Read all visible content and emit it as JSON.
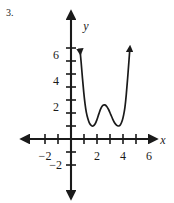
{
  "problem": {
    "number": "3."
  },
  "chart_data": {
    "type": "line",
    "title": "",
    "xlabel": "x",
    "ylabel": "y",
    "xlim": [
      -3.2,
      7.0
    ],
    "ylim": [
      -3.0,
      7.6
    ],
    "grid": false,
    "legend": null,
    "x_ticks": [
      -2,
      -1,
      1,
      2,
      3,
      4,
      5,
      6
    ],
    "x_tick_labels": [
      "−2",
      "",
      "",
      "2",
      "",
      "4",
      "",
      "6"
    ],
    "y_ticks": [
      -2,
      -1,
      1,
      2,
      3,
      4,
      5,
      6,
      7
    ],
    "y_tick_labels": [
      "−2",
      "",
      "",
      "2",
      "",
      "4",
      "",
      "6",
      ""
    ],
    "axis_arrows": [
      "left",
      "right",
      "up",
      "down"
    ],
    "series": [
      {
        "name": "quartic",
        "arrow_start": true,
        "arrow_end": true,
        "x": [
          0.7,
          0.78,
          0.88,
          0.98,
          1.08,
          1.18,
          1.3,
          1.42,
          1.55,
          1.7,
          1.85,
          2.0,
          2.15,
          2.3,
          2.45,
          2.6,
          2.75,
          2.9,
          3.05,
          3.2,
          3.35,
          3.5,
          3.65,
          3.8,
          3.95,
          4.05,
          4.15,
          4.25,
          4.35,
          4.45,
          4.52
        ],
        "y": [
          6.8,
          5.9,
          4.7,
          3.6,
          2.7,
          2.05,
          1.55,
          1.22,
          1.05,
          1.0,
          1.15,
          1.5,
          1.95,
          2.35,
          2.58,
          2.62,
          2.5,
          2.25,
          1.9,
          1.55,
          1.25,
          1.06,
          1.0,
          1.1,
          1.45,
          1.85,
          2.45,
          3.4,
          4.6,
          5.9,
          6.85
        ]
      }
    ],
    "annotations": {
      "local_minima": [
        {
          "x": 1.7,
          "y": 1.0
        },
        {
          "x": 3.65,
          "y": 1.0
        }
      ],
      "local_maximum": {
        "x": 2.6,
        "y": 2.6
      }
    },
    "colors": {
      "axis": "#1a1a1a",
      "curve": "#1a1a1a",
      "background": "#ffffff"
    }
  }
}
